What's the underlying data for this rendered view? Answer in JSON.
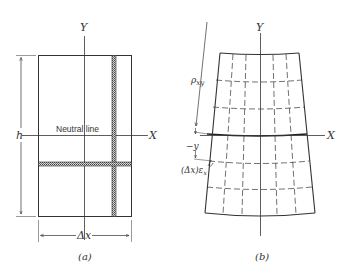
{
  "figure_a": {
    "caption": "(a)",
    "y_axis_label": "Y",
    "x_axis_label": "X",
    "height_label": "h",
    "width_label": "Δx",
    "neutral_line_label": "Neutral line"
  },
  "figure_b": {
    "caption": "(b)",
    "y_axis_label": "Y",
    "x_axis_label": "X",
    "radius_label": "ρ",
    "radius_subscript": "xy",
    "distance_label": "−y",
    "elongation_label": "(Δx)ε",
    "elongation_subscript": "x"
  },
  "colors": {
    "line": "#333333",
    "hatch": "#555555",
    "background": "#ffffff"
  }
}
